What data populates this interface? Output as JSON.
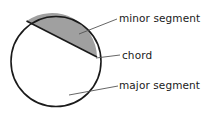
{
  "diagram": {
    "background_color": "#ffffff",
    "stroke_color": "#1a1a1a",
    "shade_color": "#a0a0a0",
    "leader_color": "#555555",
    "circle": {
      "cx": 56,
      "cy": 61.5,
      "r": 45
    },
    "chord": {
      "x1": 26.5,
      "y1": 21.0,
      "x2": 97.0,
      "y2": 57.0
    },
    "labels": {
      "minor_segment": "minor segment",
      "chord": "chord",
      "major_segment": "major segment"
    },
    "leaders": {
      "minor_segment": {
        "x1": 79,
        "y1": 34,
        "x2": 117,
        "y2": 19
      },
      "chord": {
        "x1": 96,
        "y1": 58,
        "x2": 120,
        "y2": 55
      },
      "major_segment": {
        "x1": 69,
        "y1": 95,
        "x2": 118,
        "y2": 86
      }
    }
  }
}
